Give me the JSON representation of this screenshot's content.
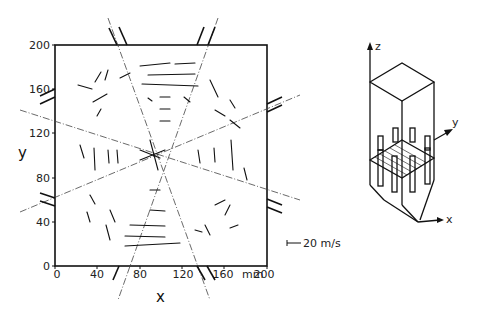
{
  "plot": {
    "x_axis_label": "x",
    "y_axis_label": "y",
    "x_unit": "mm",
    "x_ticks": [
      "0",
      "40",
      "80",
      "120",
      "160",
      "200"
    ],
    "y_ticks": [
      "0",
      "40",
      "80",
      "120",
      "160",
      "200"
    ],
    "scale_label": "20 m/s",
    "colors": {
      "ink": "#111111",
      "background": "#ffffff"
    }
  },
  "schematic": {
    "z_label": "z",
    "y_label": "y",
    "x_label": "x"
  }
}
